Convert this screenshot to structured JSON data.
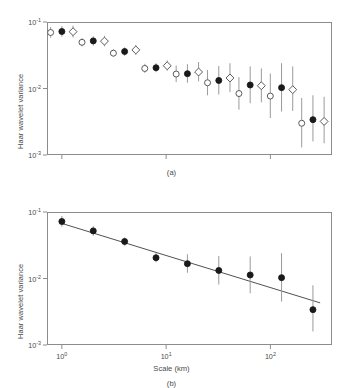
{
  "figure": {
    "background": "#ffffff",
    "axis_color": "#8c8c8c",
    "text_color": "#4a4a4a",
    "marker_fill_color": "#1a1a1a",
    "marker_open_color": "#ffffff",
    "errorbar_color": "#9a9a9a",
    "fit_line_color": "#3d3d3d"
  },
  "panel_a": {
    "caption": "(a)",
    "ylabel": "Haar wavelet variance",
    "xlabel": "",
    "ytick_labels": [
      "10",
      "10",
      "10"
    ],
    "ytick_exponents": [
      "-1",
      "-2",
      "-3"
    ],
    "xtick_labels": [
      "",
      "",
      ""
    ]
  },
  "panel_b": {
    "caption": "(b)",
    "ylabel": "Haar wavelet variance",
    "xlabel": "Scale (km)",
    "ytick_labels": [
      "10",
      "10",
      "10"
    ],
    "ytick_exponents": [
      "-1",
      "-2",
      "-3"
    ],
    "xtick_labels": [
      "10",
      "10",
      "10"
    ],
    "xtick_exponents": [
      "0",
      "1",
      "2"
    ]
  },
  "chart_data": [
    {
      "type": "scatter",
      "panel": "(a)",
      "title": "",
      "xlabel": "",
      "ylabel": "Haar wavelet variance",
      "xscale": "log",
      "yscale": "log",
      "xlim": [
        0.72,
        390
      ],
      "ylim": [
        0.001,
        0.1
      ],
      "xticks": [
        1,
        10,
        100
      ],
      "xticklabels": [
        "",
        "",
        ""
      ],
      "yticks": [
        0.1,
        0.01,
        0.001
      ],
      "yticklabels": [
        "10^-1",
        "10^-2",
        "10^-3"
      ],
      "grid": false,
      "legend": null,
      "x": [
        1,
        2,
        4,
        8,
        16,
        32,
        64,
        128,
        256
      ],
      "series": [
        {
          "name": "open-circle",
          "marker": "open-circle",
          "offset_factor": 0.78,
          "values": [
            0.0695,
            0.0495,
            0.034,
            0.02,
            0.0165,
            0.0122,
            0.0084,
            0.0077,
            0.003
          ],
          "err_low": [
            0.058,
            0.043,
            0.03,
            0.0172,
            0.0125,
            0.0079,
            0.0048,
            0.0036,
            0.0013
          ],
          "err_high": [
            0.084,
            0.057,
            0.039,
            0.0235,
            0.0222,
            0.019,
            0.0148,
            0.0168,
            0.0072
          ]
        },
        {
          "name": "filled-circle",
          "marker": "filled-circle",
          "offset_factor": 1.0,
          "values": [
            0.072,
            0.052,
            0.036,
            0.0205,
            0.0167,
            0.0132,
            0.0113,
            0.0103,
            0.0034
          ],
          "err_low": [
            0.06,
            0.044,
            0.031,
            0.0176,
            0.0122,
            0.0081,
            0.006,
            0.0045,
            0.0016
          ],
          "err_high": [
            0.087,
            0.061,
            0.0415,
            0.024,
            0.0232,
            0.0218,
            0.0215,
            0.024,
            0.0079
          ]
        },
        {
          "name": "open-diamond",
          "marker": "open-diamond",
          "offset_factor": 1.28,
          "values": [
            0.0715,
            0.0515,
            0.038,
            0.022,
            0.0177,
            0.0144,
            0.011,
            0.0096,
            0.0032
          ],
          "err_low": [
            0.0585,
            0.043,
            0.032,
            0.0185,
            0.0128,
            0.0088,
            0.0062,
            0.0046,
            0.0015
          ],
          "err_high": [
            0.088,
            0.062,
            0.0452,
            0.0264,
            0.025,
            0.024,
            0.02,
            0.0215,
            0.0075
          ]
        }
      ]
    },
    {
      "type": "scatter",
      "panel": "(b)",
      "title": "",
      "xlabel": "Scale (km)",
      "ylabel": "Haar wavelet variance",
      "xscale": "log",
      "yscale": "log",
      "xlim": [
        0.72,
        390
      ],
      "ylim": [
        0.001,
        0.1
      ],
      "xticks": [
        1,
        10,
        100
      ],
      "xticklabels": [
        "10^0",
        "10^1",
        "10^2"
      ],
      "yticks": [
        0.1,
        0.01,
        0.001
      ],
      "yticklabels": [
        "10^-1",
        "10^-2",
        "10^-3"
      ],
      "grid": false,
      "legend": null,
      "x": [
        1,
        2,
        4,
        8,
        16,
        32,
        64,
        128,
        256
      ],
      "series": [
        {
          "name": "filled-circle",
          "marker": "filled-circle",
          "offset_factor": 1.0,
          "values": [
            0.072,
            0.052,
            0.036,
            0.0205,
            0.0167,
            0.0132,
            0.0113,
            0.0103,
            0.0034
          ],
          "err_low": [
            0.06,
            0.044,
            0.031,
            0.0176,
            0.0122,
            0.0081,
            0.006,
            0.0045,
            0.0016
          ],
          "err_high": [
            0.087,
            0.061,
            0.0415,
            0.024,
            0.0232,
            0.0218,
            0.0215,
            0.024,
            0.0079
          ]
        }
      ],
      "fit_line": {
        "name": "power-law-fit",
        "x": [
          0.95,
          300
        ],
        "y": [
          0.069,
          0.0043
        ]
      }
    }
  ]
}
